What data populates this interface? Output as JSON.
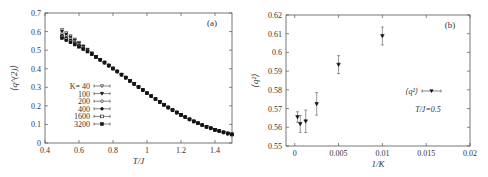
{
  "chart_data": [
    {
      "id": "a",
      "type": "scatter",
      "panel_label": "(a)",
      "title": "",
      "xlabel": "T/J",
      "ylabel": "⟨q^(2)⟩",
      "xlim": [
        0.4,
        1.5
      ],
      "ylim": [
        0,
        0.7
      ],
      "xticks": [
        0.4,
        0.6,
        0.8,
        1.0,
        1.2,
        1.4
      ],
      "xtick_labels": [
        "0.4",
        "0.6",
        "0.8",
        "1",
        "1.2",
        "1.4"
      ],
      "yticks": [
        0,
        0.1,
        0.2,
        0.3,
        0.4,
        0.5,
        0.6,
        0.7
      ],
      "ytick_labels": [
        "0",
        "0.1",
        "0.2",
        "0.3",
        "0.4",
        "0.5",
        "0.6",
        "0.7"
      ],
      "grid": false,
      "legend_position": "left-middle",
      "legend_prefix": "K=",
      "series": [
        {
          "name": "40",
          "marker": "triangle-down-open",
          "offset": 0.045
        },
        {
          "name": "100",
          "marker": "triangle-down-filled",
          "offset": 0.035
        },
        {
          "name": "200",
          "marker": "circle-open",
          "offset": 0.025
        },
        {
          "name": "400",
          "marker": "circle-filled",
          "offset": 0.015
        },
        {
          "name": "1600",
          "marker": "square-open",
          "offset": 0.007
        },
        {
          "name": "3200",
          "marker": "square-filled",
          "offset": 0.0
        }
      ],
      "x": [
        0.5,
        0.525,
        0.55,
        0.575,
        0.6,
        0.625,
        0.65,
        0.675,
        0.7,
        0.725,
        0.75,
        0.775,
        0.8,
        0.825,
        0.85,
        0.875,
        0.9,
        0.925,
        0.95,
        0.975,
        1.0,
        1.025,
        1.05,
        1.075,
        1.1,
        1.125,
        1.15,
        1.175,
        1.2,
        1.225,
        1.25,
        1.275,
        1.3,
        1.325,
        1.35,
        1.375,
        1.4,
        1.425,
        1.45,
        1.475,
        1.5
      ],
      "base_values": [
        0.565,
        0.553,
        0.542,
        0.53,
        0.518,
        0.505,
        0.492,
        0.478,
        0.463,
        0.448,
        0.433,
        0.417,
        0.401,
        0.385,
        0.368,
        0.352,
        0.335,
        0.318,
        0.301,
        0.285,
        0.268,
        0.252,
        0.236,
        0.221,
        0.206,
        0.191,
        0.177,
        0.164,
        0.151,
        0.139,
        0.127,
        0.116,
        0.106,
        0.096,
        0.087,
        0.079,
        0.071,
        0.064,
        0.057,
        0.051,
        0.046
      ],
      "finite_size_spread_until_x": 0.7
    },
    {
      "id": "b",
      "type": "scatter",
      "panel_label": "(b)",
      "title": "",
      "xlabel": "1/K",
      "ylabel": "⟨q²⟩",
      "xlim": [
        -0.001,
        0.02
      ],
      "ylim": [
        0.55,
        0.62
      ],
      "xticks": [
        0,
        0.005,
        0.01,
        0.015,
        0.02
      ],
      "xtick_labels": [
        "0",
        "0.005",
        "0.01",
        "0.015",
        "0.02"
      ],
      "yticks": [
        0.55,
        0.56,
        0.57,
        0.58,
        0.59,
        0.6,
        0.61,
        0.62
      ],
      "ytick_labels": [
        "0.55",
        "0.56",
        "0.57",
        "0.58",
        "0.59",
        "0.6",
        "0.61",
        "0.62"
      ],
      "grid": false,
      "legend_position": "right-middle",
      "series": [
        {
          "name": "⟨q²⟩",
          "marker": "triangle-down-filled",
          "x": [
            0.0003125,
            0.000625,
            0.00125,
            0.0025,
            0.005,
            0.01
          ],
          "y": [
            0.5655,
            0.5618,
            0.5632,
            0.5725,
            0.5935,
            0.6088
          ],
          "yerr": [
            0.0028,
            0.0045,
            0.006,
            0.006,
            0.0048,
            0.0048
          ]
        }
      ],
      "annotations": [
        "T/J=0.5"
      ]
    }
  ]
}
